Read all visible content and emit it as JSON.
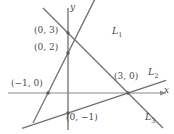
{
  "figure": {
    "kind": "coordinate-plane-three-lines",
    "axes": {
      "x_label": "x",
      "y_label": "y",
      "origin_px": [
        68,
        93
      ],
      "unit_px": 20,
      "color": "#7a7a7a"
    },
    "point_labels": [
      {
        "id": "p03",
        "text": "(0, 3)",
        "x": 34,
        "y": 26
      },
      {
        "id": "p02",
        "text": "(0, 2)",
        "x": 34,
        "y": 43
      },
      {
        "id": "pm10",
        "text": "(−1, 0)",
        "x": 11,
        "y": 79
      },
      {
        "id": "p30",
        "text": "(3, 0)",
        "x": 114,
        "y": 72
      },
      {
        "id": "p0m1",
        "text": "(0, −1)",
        "x": 66,
        "y": 113
      }
    ],
    "line_labels": [
      {
        "id": "L1",
        "base": "L",
        "sub": "1",
        "x": 112,
        "y": 26
      },
      {
        "id": "L2",
        "base": "L",
        "sub": "2",
        "x": 148,
        "y": 67
      },
      {
        "id": "L3",
        "base": "L",
        "sub": "3",
        "x": 145,
        "y": 112
      }
    ],
    "lines": [
      {
        "id": "L1",
        "label": "L1",
        "through": [
          [
            -1,
            0
          ],
          [
            0,
            2
          ]
        ],
        "slope": 2,
        "intercept": 2,
        "color": "#6e6e6e"
      },
      {
        "id": "L2",
        "label": "L2",
        "through": [
          [
            0,
            -1
          ],
          [
            3,
            0
          ]
        ],
        "slope": 0.3333,
        "intercept": -1,
        "color": "#6e6e6e"
      },
      {
        "id": "L3",
        "label": "L3",
        "through": [
          [
            0,
            3
          ],
          [
            3,
            0
          ]
        ],
        "slope": -1,
        "intercept": 3,
        "color": "#6e6e6e"
      }
    ],
    "marked_points": [
      {
        "id": "p03",
        "coords": [
          0,
          3
        ]
      },
      {
        "id": "p02",
        "coords": [
          0,
          2
        ]
      },
      {
        "id": "pm10",
        "coords": [
          -1,
          0
        ]
      },
      {
        "id": "p30",
        "coords": [
          3,
          0
        ]
      },
      {
        "id": "p0m1",
        "coords": [
          0,
          -1
        ]
      }
    ]
  }
}
